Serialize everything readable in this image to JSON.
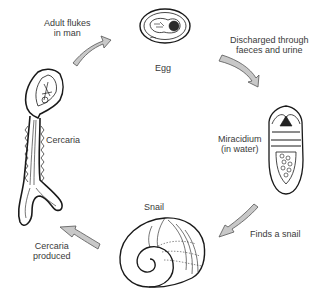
{
  "diagram": {
    "type": "life-cycle",
    "colors": {
      "arrow_fill": "#c8c8c8",
      "arrow_stroke": "#555555",
      "line": "#1a1a1a",
      "text": "#3a3a3a"
    },
    "stages": [
      {
        "id": "egg",
        "label": "Egg"
      },
      {
        "id": "miracidium",
        "label_line1": "Miracidium",
        "label_line2": "(in water)"
      },
      {
        "id": "snail",
        "label": "Snail"
      },
      {
        "id": "cercaria",
        "label": "Cercaria"
      }
    ],
    "transitions": [
      {
        "from": "cercaria",
        "to": "egg",
        "label_line1": "Adult flukes",
        "label_line2": "in man"
      },
      {
        "from": "egg",
        "to": "miracidium",
        "label_line1": "Discharged through",
        "label_line2": "faeces and urine"
      },
      {
        "from": "miracidium",
        "to": "snail",
        "label": "Finds a snail"
      },
      {
        "from": "snail",
        "to": "cercaria",
        "label_line1": "Cercaria",
        "label_line2": "produced"
      }
    ]
  }
}
